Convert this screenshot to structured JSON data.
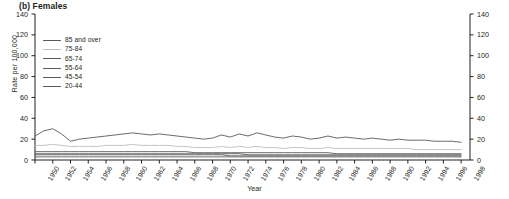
{
  "panel": {
    "title": "(b) Females"
  },
  "axes": {
    "ylabel": "Rate per 100,000",
    "xlabel": "Year",
    "yticks": [
      0,
      20,
      40,
      60,
      80,
      100,
      120,
      140
    ],
    "ylim": [
      0,
      140
    ],
    "xlim": [
      1950,
      1999
    ],
    "xticks": [
      1950,
      1952,
      1954,
      1956,
      1958,
      1960,
      1962,
      1964,
      1966,
      1968,
      1970,
      1972,
      1974,
      1976,
      1978,
      1980,
      1982,
      1984,
      1986,
      1988,
      1990,
      1992,
      1994,
      1996,
      1998
    ]
  },
  "colors": {
    "line_dark": "#58595b",
    "line_mid": "#808285",
    "line_light": "#bcbec0",
    "axis": "#231f20",
    "text": "#231f20"
  },
  "chart_data": {
    "type": "line",
    "title": "(b) Females",
    "xlabel": "Year",
    "ylabel": "Rate per 100,000",
    "ylim": [
      0,
      140
    ],
    "xlim": [
      1950,
      1999
    ],
    "grid": false,
    "legend_position": "upper-left-inside",
    "x": [
      1950,
      1951,
      1952,
      1953,
      1954,
      1955,
      1956,
      1957,
      1958,
      1959,
      1960,
      1961,
      1962,
      1963,
      1964,
      1965,
      1966,
      1967,
      1968,
      1969,
      1970,
      1971,
      1972,
      1973,
      1974,
      1975,
      1976,
      1977,
      1978,
      1979,
      1980,
      1981,
      1982,
      1983,
      1984,
      1985,
      1986,
      1987,
      1988,
      1989,
      1990,
      1991,
      1992,
      1993,
      1994,
      1995,
      1996,
      1997,
      1998
    ],
    "series": [
      {
        "name": "85 and over",
        "color": "#58595b",
        "values": [
          23,
          28,
          30,
          25,
          18,
          20,
          21,
          22,
          23,
          24,
          25,
          26,
          25,
          24,
          25,
          24,
          23,
          22,
          21,
          20,
          21,
          24,
          22,
          25,
          23,
          26,
          24,
          22,
          21,
          23,
          22,
          20,
          21,
          23,
          21,
          22,
          21,
          20,
          21,
          20,
          19,
          20,
          19,
          19,
          19,
          18,
          18,
          18,
          17
        ]
      },
      {
        "name": "75-84",
        "color": "#bcbec0",
        "values": [
          14,
          14,
          15,
          14,
          13,
          13,
          13,
          13,
          14,
          14,
          14,
          15,
          14,
          14,
          14,
          14,
          13,
          13,
          12,
          12,
          12,
          13,
          12,
          13,
          12,
          13,
          12,
          12,
          11,
          12,
          12,
          11,
          11,
          12,
          11,
          11,
          11,
          11,
          11,
          11,
          11,
          11,
          11,
          10,
          10,
          10,
          10,
          10,
          10
        ]
      },
      {
        "name": "65-74",
        "color": "#58595b",
        "values": [
          8,
          8,
          8,
          8,
          8,
          8,
          8,
          8,
          8,
          8,
          8,
          8,
          8,
          8,
          8,
          8,
          8,
          8,
          7,
          7,
          7,
          7,
          7,
          7,
          7,
          7,
          7,
          7,
          7,
          7,
          7,
          7,
          7,
          7,
          6,
          6,
          6,
          6,
          6,
          6,
          6,
          6,
          6,
          6,
          6,
          6,
          6,
          6,
          6
        ]
      },
      {
        "name": "55-64",
        "color": "#58595b",
        "values": [
          6,
          6,
          6,
          6,
          6,
          6,
          6,
          6,
          6,
          6,
          6,
          6,
          6,
          6,
          6,
          6,
          6,
          6,
          6,
          6,
          6,
          6,
          6,
          6,
          5,
          5,
          5,
          5,
          5,
          5,
          5,
          5,
          5,
          5,
          5,
          5,
          5,
          5,
          5,
          5,
          5,
          5,
          5,
          5,
          5,
          5,
          5,
          5,
          5
        ]
      },
      {
        "name": "45-54",
        "color": "#58595b",
        "values": [
          5,
          5,
          5,
          5,
          5,
          5,
          5,
          5,
          5,
          5,
          5,
          5,
          5,
          5,
          5,
          5,
          5,
          5,
          5,
          5,
          5,
          5,
          4,
          4,
          4,
          4,
          4,
          4,
          4,
          4,
          4,
          4,
          4,
          4,
          4,
          4,
          4,
          4,
          4,
          4,
          4,
          4,
          4,
          4,
          4,
          4,
          4,
          4,
          4
        ]
      },
      {
        "name": "20-44",
        "color": "#58595b",
        "values": [
          3,
          3,
          3,
          3,
          3,
          3,
          3,
          3,
          3,
          3,
          3,
          3,
          3,
          3,
          3,
          3,
          3,
          3,
          3,
          3,
          3,
          3,
          3,
          3,
          3,
          3,
          3,
          3,
          3,
          3,
          3,
          3,
          3,
          3,
          3,
          3,
          3,
          3,
          3,
          3,
          3,
          3,
          3,
          3,
          3,
          3,
          3,
          3,
          3
        ]
      }
    ]
  },
  "legend": {
    "items": [
      {
        "label": "85 and over",
        "color": "#58595b"
      },
      {
        "label": "75-84",
        "color": "#bcbec0"
      },
      {
        "label": "65-74",
        "color": "#58595b"
      },
      {
        "label": "55-64",
        "color": "#58595b"
      },
      {
        "label": "45-54",
        "color": "#58595b"
      },
      {
        "label": "20-44",
        "color": "#58595b"
      }
    ]
  }
}
